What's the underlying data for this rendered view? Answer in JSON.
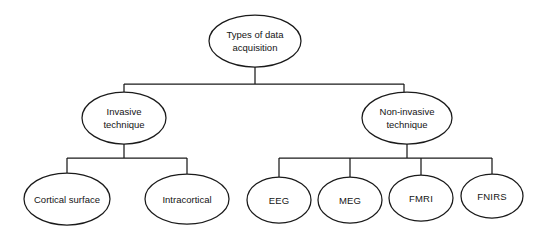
{
  "diagram": {
    "title": "Types of data acquisition",
    "type": "tree",
    "background_color": "#ffffff",
    "line_color": "#1a1a1a",
    "text_color": "#141414",
    "node_shape": "ellipse",
    "nodes": {
      "root": {
        "id": "root",
        "lines": [
          "Types of data",
          "acquisition"
        ],
        "line1": "Types of data",
        "line2": "acquisition",
        "cx": 255,
        "cy": 41,
        "rx": 46,
        "ry": 26
      },
      "invasive": {
        "id": "invasive",
        "lines": [
          "Invasive",
          "technique"
        ],
        "line1": "Invasive",
        "line2": "technique",
        "cx": 124,
        "cy": 118,
        "rx": 42,
        "ry": 26
      },
      "noninvasive": {
        "id": "noninvasive",
        "lines": [
          "Non-invasive",
          "technique"
        ],
        "line1": "Non-invasive",
        "line2": "technique",
        "cx": 407,
        "cy": 118,
        "rx": 45,
        "ry": 26
      },
      "cortical_surface": {
        "id": "cortical-surface",
        "label": "Cortical surface",
        "cx": 67,
        "cy": 199,
        "rx": 43,
        "ry": 26
      },
      "intracortical": {
        "id": "intracortical",
        "label": "Intracortical",
        "cx": 187,
        "cy": 199,
        "rx": 42,
        "ry": 25
      },
      "eeg": {
        "id": "eeg",
        "label": "EEG",
        "cx": 279,
        "cy": 200,
        "rx": 32,
        "ry": 23
      },
      "meg": {
        "id": "meg",
        "label": "MEG",
        "cx": 350,
        "cy": 200,
        "rx": 32,
        "ry": 23
      },
      "fmri": {
        "id": "fmri",
        "label": "FMRI",
        "cx": 421,
        "cy": 198,
        "rx": 32,
        "ry": 23
      },
      "fnirs": {
        "id": "fnirs",
        "label": "FNIRS",
        "cx": 492,
        "cy": 196,
        "rx": 31,
        "ry": 22
      }
    },
    "edges": [
      {
        "from": "root",
        "to": "invasive"
      },
      {
        "from": "root",
        "to": "noninvasive"
      },
      {
        "from": "invasive",
        "to": "cortical_surface"
      },
      {
        "from": "invasive",
        "to": "intracortical"
      },
      {
        "from": "noninvasive",
        "to": "eeg"
      },
      {
        "from": "noninvasive",
        "to": "meg"
      },
      {
        "from": "noninvasive",
        "to": "fmri"
      },
      {
        "from": "noninvasive",
        "to": "fnirs"
      }
    ],
    "hierarchy": {
      "root_label": "Types of data acquisition",
      "children": [
        {
          "label": "Invasive technique",
          "children": [
            "Cortical surface",
            "Intracortical"
          ]
        },
        {
          "label": "Non-invasive technique",
          "children": [
            "EEG",
            "MEG",
            "FMRI",
            "FNIRS"
          ]
        }
      ]
    }
  }
}
